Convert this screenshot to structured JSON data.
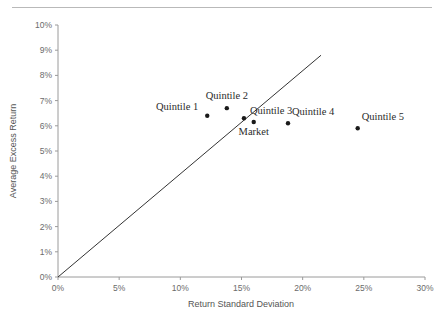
{
  "chart_data": {
    "type": "scatter",
    "title": "",
    "xlabel": "Return Standard Deviation",
    "ylabel": "Average Excess Return",
    "xlim": [
      0,
      30
    ],
    "ylim": [
      0,
      10
    ],
    "xtick_labels": [
      "0%",
      "5%",
      "10%",
      "15%",
      "20%",
      "25%",
      "30%"
    ],
    "xticks": [
      0,
      5,
      10,
      15,
      20,
      25,
      30
    ],
    "ytick_labels": [
      "0%",
      "1%",
      "2%",
      "3%",
      "4%",
      "5%",
      "6%",
      "7%",
      "8%",
      "9%",
      "10%"
    ],
    "yticks": [
      0,
      1,
      2,
      3,
      4,
      5,
      6,
      7,
      8,
      9,
      10
    ],
    "grid": false,
    "legend": "none",
    "points": [
      {
        "name": "Quintile 1",
        "x": 12.2,
        "y": 6.4,
        "label_pos": "left"
      },
      {
        "name": "Quintile 2",
        "x": 13.8,
        "y": 6.7,
        "label_pos": "above"
      },
      {
        "name": "Quintile 3",
        "x": 15.2,
        "y": 6.3,
        "label_pos": "right"
      },
      {
        "name": "Market",
        "x": 16.0,
        "y": 6.15,
        "label_pos": "below"
      },
      {
        "name": "Quintile 4",
        "x": 18.8,
        "y": 6.1,
        "label_pos": "above-right"
      },
      {
        "name": "Quintile 5",
        "x": 24.5,
        "y": 5.9,
        "label_pos": "above-right"
      }
    ],
    "reference_line": {
      "name": "capital-market-line",
      "x0": 0,
      "y0": 0,
      "x1": 21.5,
      "y1": 8.8
    },
    "colors": {
      "marker": "#1a1a1a",
      "line": "#333333",
      "axis": "#9a9a9a",
      "tick_text": "#6b6b6b",
      "label_text": "#2b2b2b",
      "rule": "#b9b9b9",
      "background": "#ffffff"
    }
  }
}
